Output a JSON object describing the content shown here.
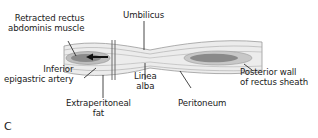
{
  "figure": {
    "panel_label": "C",
    "labels": {
      "retracted_rectus": [
        "Retracted rectus",
        "abdominis muscle"
      ],
      "umbilicus": [
        "Umbilicus"
      ],
      "inferior_epigastric": [
        "Inferior",
        "epigastric artery"
      ],
      "linea_alba": [
        "Linea",
        "alba"
      ],
      "posterior_wall": [
        "Posterior wall",
        "of rectus sheath"
      ],
      "extraperitoneal_fat": [
        "Extraperitoneal",
        "fat"
      ],
      "peritoneum": [
        "Peritoneum"
      ]
    },
    "colors": {
      "band_fill": "#ececec",
      "band_stroke": "#9a9a9a",
      "muscle_fill": "#8a8a8a",
      "muscle_light": "#bdbdbd",
      "leader": "#1a1a1a",
      "arrow": "#111111"
    }
  }
}
